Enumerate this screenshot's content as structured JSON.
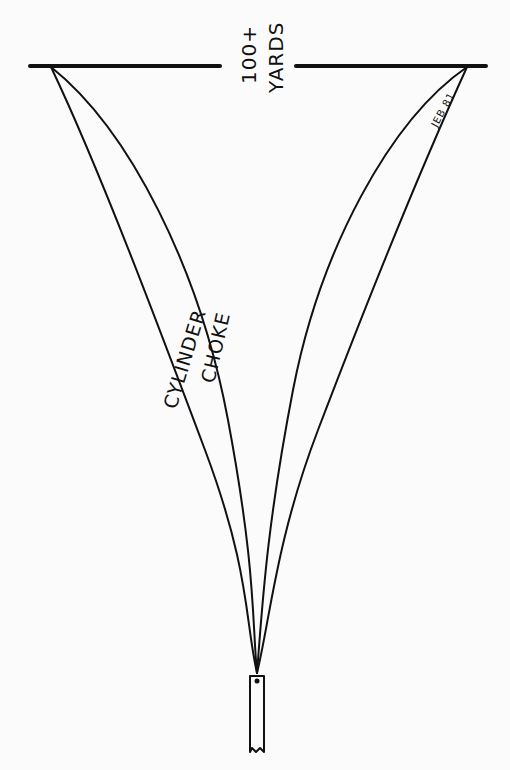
{
  "diagram": {
    "range_label": {
      "line1": "100+",
      "line2": "YARDS"
    },
    "curves": {
      "cylinder_label": "CYLINDER",
      "choke_label": "CHOKE"
    },
    "signature": "JEB 81",
    "colors": {
      "background": "#fbfbfb",
      "ink": "#111111"
    }
  }
}
